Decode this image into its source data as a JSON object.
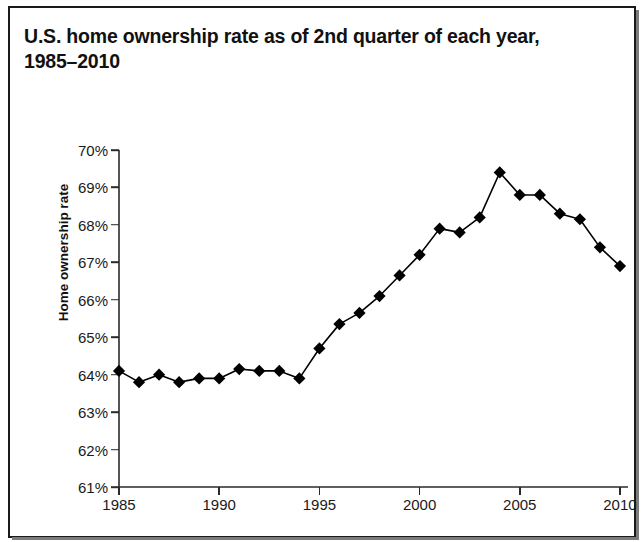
{
  "title": "U.S. home ownership rate as of 2nd quarter of each year, 1985–2010",
  "colors": {
    "ink": "#111111",
    "axis": "#2a2a2a",
    "marker": "#000000",
    "line": "#000000",
    "background": "#ffffff",
    "frame": "#1a1a1a"
  },
  "chart_data": {
    "type": "line",
    "title": "U.S. home ownership rate as of 2nd quarter of each year, 1985–2010",
    "xlabel": "",
    "ylabel": "Home ownership rate",
    "x": [
      1985,
      1986,
      1987,
      1988,
      1989,
      1990,
      1991,
      1992,
      1993,
      1994,
      1995,
      1996,
      1997,
      1998,
      1999,
      2000,
      2001,
      2002,
      2003,
      2004,
      2005,
      2006,
      2007,
      2008,
      2009,
      2010
    ],
    "values": [
      64.1,
      63.8,
      64.0,
      63.8,
      63.9,
      63.9,
      64.15,
      64.1,
      64.1,
      63.9,
      64.7,
      65.35,
      65.65,
      66.1,
      66.65,
      67.2,
      67.9,
      67.8,
      68.2,
      69.4,
      68.8,
      68.8,
      68.3,
      68.15,
      67.4,
      66.9
    ],
    "series": [
      {
        "name": "Home ownership rate",
        "values": [
          64.1,
          63.8,
          64.0,
          63.8,
          63.9,
          63.9,
          64.15,
          64.1,
          64.1,
          63.9,
          64.7,
          65.35,
          65.65,
          66.1,
          66.65,
          67.2,
          67.9,
          67.8,
          68.2,
          69.4,
          68.8,
          68.8,
          68.3,
          68.15,
          67.4,
          66.9
        ]
      }
    ],
    "xlim": [
      1985,
      2010.4
    ],
    "ylim": [
      61,
      70
    ],
    "x_ticks": [
      1985,
      1990,
      1995,
      2000,
      2005,
      2010
    ],
    "x_tick_labels": [
      "1985",
      "1990",
      "1995",
      "2000",
      "2005",
      "2010"
    ],
    "y_ticks": [
      61,
      62,
      63,
      64,
      65,
      66,
      67,
      68,
      69,
      70
    ],
    "y_tick_labels": [
      "61%",
      "62%",
      "63%",
      "64%",
      "65%",
      "66%",
      "67%",
      "68%",
      "69%",
      "70%"
    ],
    "grid": false,
    "legend": false,
    "marker": "diamond",
    "marker_size": 9,
    "line_width": 1.6
  }
}
